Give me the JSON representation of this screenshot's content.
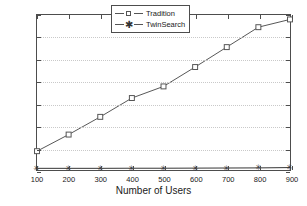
{
  "chart_data": {
    "type": "line",
    "title": "",
    "xlabel": "Number of Users",
    "ylabel": "Running time(s)",
    "x": [
      100,
      200,
      300,
      400,
      500,
      600,
      700,
      800,
      900
    ],
    "xticklabels": [
      "100",
      "200",
      "300",
      "400",
      "500",
      "600",
      "700",
      "800",
      "900"
    ],
    "yticklabels": [
      "0",
      "20",
      "40",
      "60",
      "80",
      "100",
      "120",
      "140"
    ],
    "yticks": [
      0,
      20,
      40,
      60,
      80,
      100,
      120,
      140
    ],
    "xlim": [
      100,
      900
    ],
    "ylim": [
      0,
      140
    ],
    "grid": true,
    "legend_position": "top-center",
    "series": [
      {
        "name": "Tradition",
        "marker": "square",
        "values": [
          17,
          32,
          48,
          65,
          75.5,
          93,
          111,
          129,
          136
        ]
      },
      {
        "name": "TwinSearch",
        "marker": "star",
        "values": [
          1.5,
          1.5,
          1.5,
          1.6,
          1.6,
          1.7,
          1.8,
          1.9,
          2.2
        ]
      }
    ],
    "colors": {
      "axis": "#4d4d4d",
      "grid": "#c9c9c9",
      "series1": "#555555",
      "series2": "#333333",
      "background": "#ffffff"
    }
  }
}
